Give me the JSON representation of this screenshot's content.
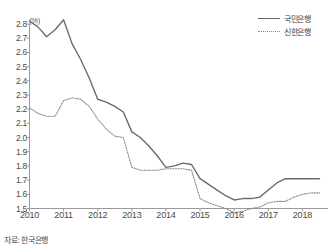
{
  "unit_label": "(%)",
  "source_note": "자료: 한국은행",
  "legend": [
    {
      "name": "kookmin",
      "label": "국민은행",
      "style": "solid",
      "color": "#6b6b6b"
    },
    {
      "name": "shinhan",
      "label": "신한은행",
      "style": "dotted",
      "color": "#8a8a8a"
    }
  ],
  "chart_data": {
    "type": "line",
    "title": "",
    "xlabel": "",
    "ylabel": "(%)",
    "unit": "%",
    "grid": false,
    "legend_position": "top-right",
    "ylim": [
      1.5,
      2.8
    ],
    "yticks": [
      "2.8",
      "2.7",
      "2.6",
      "2.5",
      "2.4",
      "2.3",
      "2.2",
      "2.1",
      "2.0",
      "1.9",
      "1.8",
      "1.7",
      "1.6",
      "1.5"
    ],
    "xlim": [
      2010.0,
      2018.75
    ],
    "xticks": [
      "2010",
      "2011",
      "2012",
      "2013",
      "2014",
      "2015",
      "2016",
      "2017",
      "2018"
    ],
    "x": [
      2010.0,
      2010.25,
      2010.5,
      2010.75,
      2011.0,
      2011.25,
      2011.5,
      2011.75,
      2012.0,
      2012.25,
      2012.5,
      2012.75,
      2013.0,
      2013.25,
      2013.5,
      2013.75,
      2014.0,
      2014.25,
      2014.5,
      2014.75,
      2015.0,
      2015.25,
      2015.5,
      2015.75,
      2016.0,
      2016.25,
      2016.5,
      2016.75,
      2017.0,
      2017.25,
      2017.5,
      2017.75,
      2018.0,
      2018.25,
      2018.5
    ],
    "series": [
      {
        "name": "국민은행",
        "style": "solid",
        "color": "#6b6b6b",
        "values": [
          2.82,
          2.78,
          2.71,
          2.76,
          2.83,
          2.66,
          2.55,
          2.42,
          2.27,
          2.25,
          2.22,
          2.18,
          2.04,
          2.0,
          1.94,
          1.87,
          1.79,
          1.8,
          1.82,
          1.81,
          1.71,
          1.67,
          1.63,
          1.59,
          1.56,
          1.57,
          1.57,
          1.58,
          1.63,
          1.68,
          1.71,
          1.71,
          1.71,
          1.71,
          1.71
        ]
      },
      {
        "name": "신한은행",
        "style": "dotted",
        "color": "#8a8a8a",
        "values": [
          2.21,
          2.17,
          2.15,
          2.15,
          2.26,
          2.28,
          2.27,
          2.22,
          2.13,
          2.06,
          2.01,
          2.0,
          1.79,
          1.77,
          1.77,
          1.77,
          1.78,
          1.78,
          1.78,
          1.77,
          1.57,
          1.54,
          1.52,
          1.5,
          1.47,
          1.48,
          1.5,
          1.51,
          1.54,
          1.55,
          1.55,
          1.58,
          1.6,
          1.61,
          1.61
        ]
      }
    ]
  }
}
